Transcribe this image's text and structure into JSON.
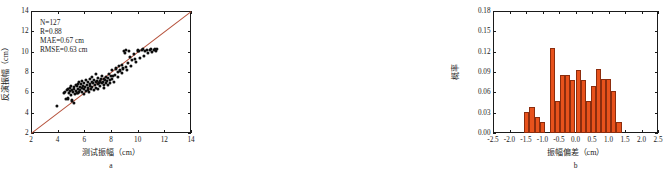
{
  "figure": {
    "panels": [
      {
        "id": "a",
        "caption": "a"
      },
      {
        "id": "b",
        "caption": "b"
      }
    ]
  },
  "chart_data": [
    {
      "type": "scatter",
      "panel": "a",
      "title": "",
      "xlabel": "测试振幅（cm）",
      "ylabel": "反演振幅（cm）",
      "xlim": [
        2,
        14
      ],
      "ylim": [
        2,
        14
      ],
      "xticks": [
        2,
        4,
        6,
        8,
        10,
        12,
        14
      ],
      "yticks": [
        2,
        4,
        6,
        8,
        10,
        12,
        14
      ],
      "xticklabels": [
        "2",
        "4",
        "6",
        "8",
        "10",
        "12",
        "14"
      ],
      "yticklabels": [
        "2",
        "4",
        "6",
        "8",
        "10",
        "12",
        "14"
      ],
      "grid": false,
      "legend": "none",
      "annotations": [
        "N=127",
        "R=0.88",
        "MAE=0.67 cm",
        "RMSE=0.63 cm"
      ],
      "reference_line": {
        "label": "1:1 line",
        "color": "#b5503a",
        "from": [
          2,
          2
        ],
        "to": [
          14,
          14
        ]
      },
      "marker_color": "#0d0d0d",
      "points": [
        [
          3.95,
          4.65
        ],
        [
          4.45,
          5.95
        ],
        [
          4.55,
          6.0
        ],
        [
          4.6,
          5.35
        ],
        [
          4.7,
          6.2
        ],
        [
          4.75,
          5.4
        ],
        [
          4.8,
          6.35
        ],
        [
          4.85,
          5.9
        ],
        [
          4.9,
          6.1
        ],
        [
          4.95,
          6.45
        ],
        [
          5.0,
          5.7
        ],
        [
          5.0,
          6.6
        ],
        [
          5.05,
          6.25
        ],
        [
          5.1,
          5.2
        ],
        [
          5.15,
          6.0
        ],
        [
          5.2,
          6.5
        ],
        [
          5.2,
          4.95
        ],
        [
          5.25,
          6.3
        ],
        [
          5.3,
          5.85
        ],
        [
          5.35,
          6.75
        ],
        [
          5.4,
          6.15
        ],
        [
          5.45,
          6.6
        ],
        [
          5.5,
          5.95
        ],
        [
          5.5,
          6.85
        ],
        [
          5.55,
          6.35
        ],
        [
          5.6,
          6.05
        ],
        [
          5.6,
          7.0
        ],
        [
          5.65,
          6.55
        ],
        [
          5.7,
          6.2
        ],
        [
          5.75,
          6.8
        ],
        [
          5.8,
          6.4
        ],
        [
          5.8,
          7.1
        ],
        [
          5.85,
          6.0
        ],
        [
          5.9,
          6.65
        ],
        [
          5.95,
          6.3
        ],
        [
          6.0,
          6.95
        ],
        [
          6.0,
          5.85
        ],
        [
          6.05,
          6.5
        ],
        [
          6.1,
          7.2
        ],
        [
          6.15,
          6.15
        ],
        [
          6.2,
          6.7
        ],
        [
          6.25,
          6.4
        ],
        [
          6.3,
          7.05
        ],
        [
          6.35,
          6.0
        ],
        [
          6.4,
          6.6
        ],
        [
          6.4,
          7.35
        ],
        [
          6.45,
          6.85
        ],
        [
          6.5,
          6.3
        ],
        [
          6.55,
          7.0
        ],
        [
          6.6,
          6.55
        ],
        [
          6.6,
          7.55
        ],
        [
          6.65,
          6.9
        ],
        [
          6.7,
          6.2
        ],
        [
          6.75,
          7.25
        ],
        [
          6.8,
          6.7
        ],
        [
          6.85,
          7.05
        ],
        [
          6.9,
          6.45
        ],
        [
          6.9,
          7.8
        ],
        [
          6.95,
          7.1
        ],
        [
          7.0,
          6.85
        ],
        [
          7.0,
          6.3
        ],
        [
          7.05,
          7.4
        ],
        [
          7.1,
          6.95
        ],
        [
          7.15,
          7.15
        ],
        [
          7.2,
          6.6
        ],
        [
          7.25,
          7.3
        ],
        [
          7.3,
          6.9
        ],
        [
          7.35,
          7.6
        ],
        [
          7.4,
          7.05
        ],
        [
          7.45,
          6.45
        ],
        [
          7.5,
          7.35
        ],
        [
          7.5,
          6.75
        ],
        [
          7.55,
          7.2
        ],
        [
          7.6,
          6.9
        ],
        [
          7.65,
          7.55
        ],
        [
          7.7,
          7.1
        ],
        [
          7.75,
          6.7
        ],
        [
          7.8,
          7.45
        ],
        [
          7.85,
          7.85
        ],
        [
          7.9,
          7.2
        ],
        [
          7.95,
          6.95
        ],
        [
          8.0,
          7.6
        ],
        [
          8.05,
          8.2
        ],
        [
          8.1,
          7.3
        ],
        [
          8.2,
          7.05
        ],
        [
          8.3,
          7.75
        ],
        [
          8.4,
          8.35
        ],
        [
          8.5,
          8.0
        ],
        [
          8.55,
          7.5
        ],
        [
          8.6,
          8.6
        ],
        [
          8.7,
          8.15
        ],
        [
          8.8,
          7.9
        ],
        [
          8.85,
          8.7
        ],
        [
          8.9,
          8.35
        ],
        [
          9.0,
          10.05
        ],
        [
          9.05,
          9.9
        ],
        [
          9.1,
          8.5
        ],
        [
          9.15,
          10.2
        ],
        [
          9.2,
          8.2
        ],
        [
          9.3,
          8.85
        ],
        [
          9.35,
          10.1
        ],
        [
          9.4,
          9.5
        ],
        [
          9.5,
          8.6
        ],
        [
          9.6,
          9.15
        ],
        [
          9.7,
          9.75
        ],
        [
          9.8,
          9.3
        ],
        [
          9.9,
          8.95
        ],
        [
          10.0,
          10.05
        ],
        [
          10.05,
          10.2
        ],
        [
          10.1,
          10.1
        ],
        [
          10.2,
          9.35
        ],
        [
          10.3,
          10.15
        ],
        [
          10.4,
          10.25
        ],
        [
          10.5,
          9.6
        ],
        [
          10.55,
          10.1
        ],
        [
          10.7,
          10.2
        ],
        [
          10.8,
          9.9
        ],
        [
          10.9,
          10.15
        ],
        [
          11.0,
          10.3
        ],
        [
          11.1,
          9.95
        ],
        [
          11.2,
          10.2
        ],
        [
          11.3,
          10.25
        ],
        [
          11.4,
          10.05
        ],
        [
          11.45,
          10.3
        ],
        [
          7.2,
          7.0
        ],
        [
          6.3,
          6.25
        ],
        [
          5.45,
          5.95
        ],
        [
          8.15,
          7.65
        ]
      ]
    },
    {
      "type": "bar",
      "panel": "b",
      "title": "",
      "xlabel": "振幅偏差（cm）",
      "ylabel": "概率",
      "xlim": [
        -2.5,
        2.5
      ],
      "ylim": [
        0.0,
        0.18
      ],
      "xticks": [
        -2.5,
        -2.0,
        -1.5,
        -1.0,
        -0.5,
        0.0,
        0.5,
        1.0,
        1.5,
        2.0,
        2.5
      ],
      "yticks": [
        0.0,
        0.03,
        0.06,
        0.09,
        0.12,
        0.15,
        0.18
      ],
      "xticklabels": [
        "-2.5",
        "-2.0",
        "-1.5",
        "-1.0",
        "-0.5",
        "0.0",
        "0.5",
        "1.0",
        "1.5",
        "2.0",
        "2.5"
      ],
      "yticklabels": [
        "0.00",
        "0.03",
        "0.06",
        "0.09",
        "0.12",
        "0.15",
        "0.18"
      ],
      "grid": false,
      "legend": "none",
      "bar_color": "#e8521c",
      "bar_edge_color": "#8c2d0e",
      "bin_width": 0.155,
      "bin_left_edges": [
        -1.55,
        -1.395,
        -1.24,
        -1.085,
        -0.93,
        -0.775,
        -0.62,
        -0.465,
        -0.31,
        -0.155,
        0.0,
        0.155,
        0.31,
        0.465,
        0.62,
        0.775,
        0.93,
        1.085,
        1.24,
        1.395
      ],
      "values": [
        0.031,
        0.039,
        0.024,
        0.016,
        0.0,
        0.125,
        0.047,
        0.086,
        0.086,
        0.078,
        0.093,
        0.078,
        0.047,
        0.07,
        0.094,
        0.079,
        0.079,
        0.062,
        0.016,
        0.0
      ]
    }
  ]
}
